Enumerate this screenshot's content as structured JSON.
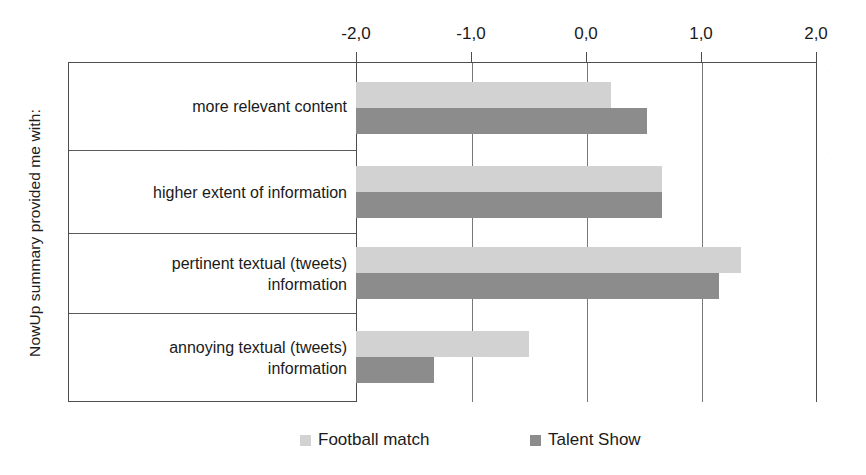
{
  "chart_data": {
    "type": "bar",
    "orientation": "horizontal",
    "title": "",
    "xlabel": "",
    "ylabel": "NowUp summary provided me with:",
    "xlim": [
      -2.0,
      2.0
    ],
    "xticks": [
      "-2,0",
      "-1,0",
      "0,0",
      "1,0",
      "2,0"
    ],
    "xtick_values": [
      -2.0,
      -1.0,
      0.0,
      1.0,
      2.0
    ],
    "grid": true,
    "legend_position": "bottom",
    "decimal_separator": ",",
    "categories": [
      "more relevant content",
      "higher extent of information",
      "pertinent textual (tweets) information",
      "annoying textual (tweets) information"
    ],
    "category_lines": [
      [
        "more relevant content"
      ],
      [
        "higher extent of information"
      ],
      [
        "pertinent textual (tweets)",
        "information"
      ],
      [
        "annoying textual (tweets)",
        "information"
      ]
    ],
    "series": [
      {
        "name": "Football match",
        "color": "#d2d2d2",
        "values": [
          0.22,
          0.66,
          1.35,
          -0.5
        ]
      },
      {
        "name": "Talent Show",
        "color": "#8c8c8c",
        "values": [
          0.53,
          0.66,
          1.16,
          -1.32
        ]
      }
    ]
  },
  "axis": {
    "y_title": "NowUp summary provided me with:",
    "tick_labels": [
      "-2,0",
      "-1,0",
      "0,0",
      "1,0",
      "2,0"
    ]
  },
  "legend": {
    "items": [
      {
        "label": "Football match",
        "color": "#d2d2d2"
      },
      {
        "label": "Talent Show",
        "color": "#8c8c8c"
      }
    ]
  },
  "categories": {
    "row1_line1": "more relevant content",
    "row2_line1": "higher extent of information",
    "row3_line1": "pertinent textual (tweets)",
    "row3_line2": "information",
    "row4_line1": "annoying textual (tweets)",
    "row4_line2": "information"
  },
  "colors": {
    "series_a": "#d2d2d2",
    "series_b": "#8c8c8c",
    "axis": "#4d4d4d",
    "grid": "#777777",
    "text": "#1a1a1a",
    "background": "#ffffff"
  }
}
